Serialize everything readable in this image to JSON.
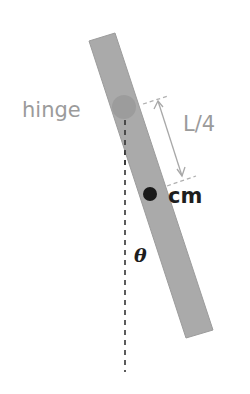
{
  "diagram": {
    "type": "physical-pendulum",
    "labels": {
      "hinge": "hinge",
      "length": "L/4",
      "center_of_mass": "cm",
      "angle": "θ"
    },
    "colors": {
      "rod": "#aaaaaa",
      "rod_edge": "#9c9c9c",
      "hinge": "#9a9a9a",
      "cm_dot": "#1a1a1a",
      "label_gray": "#9b9b9b",
      "label_dark": "#1e1e1e",
      "dimension_line": "#a8a8a8",
      "vertical_line": "#333333"
    }
  }
}
